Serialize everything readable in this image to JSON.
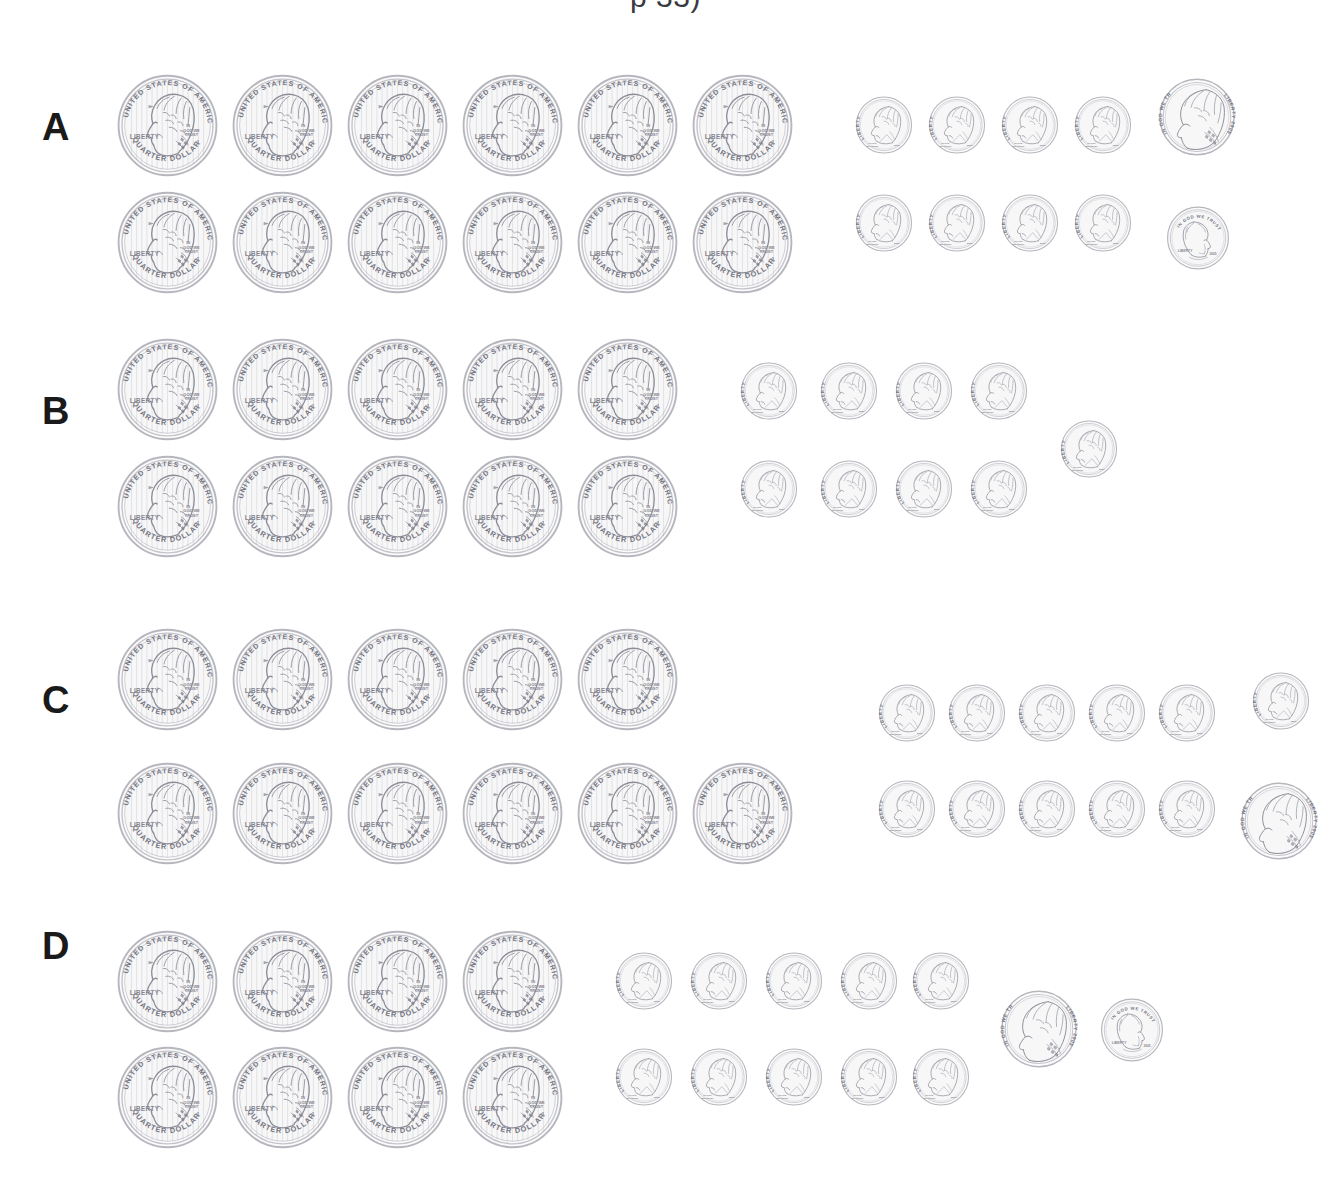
{
  "page": {
    "title_partial": "p 33)",
    "background_color": "#ffffff",
    "label_color": "#1a1a1a",
    "coin_outline_color": "#8d8d98",
    "coin_fill_color": "#f7f7f8"
  },
  "coin_types": {
    "quarter": {
      "name": "quarter",
      "value_label": "QUARTER DOLLAR",
      "obverse_country": "UNITED STATES OF AMERICA",
      "obverse_liberty": "LIBERTY",
      "obverse_motto": "IN GOD WE TRUST",
      "portrait": "George Washington",
      "value_cents": 25,
      "diameter_px": 103
    },
    "dime": {
      "name": "dime",
      "obverse_liberty": "LIBERTY",
      "obverse_motto": "IN GOD WE TRUST",
      "obverse_date": "2005",
      "portrait": "Franklin D. Roosevelt",
      "value_cents": 10,
      "diameter_px": 58
    },
    "nickel": {
      "name": "nickel",
      "obverse_liberty": "LIBERTY 2005",
      "obverse_motto": "IN GOD WE TRUST",
      "portrait": "Thomas Jefferson",
      "value_cents": 5,
      "diameter_px": 78
    },
    "penny": {
      "name": "penny",
      "obverse_liberty": "LIBERTY",
      "obverse_motto": "IN GOD WE TRUST",
      "obverse_date": "2005",
      "portrait": "Abraham Lincoln",
      "value_cents": 1,
      "diameter_px": 64
    }
  },
  "groups": [
    {
      "label": "A",
      "label_x": 42,
      "label_y": 108,
      "top": 30,
      "height": 300,
      "counts": {
        "quarter": 12,
        "dime": 8,
        "nickel": 1,
        "penny": 1
      },
      "total_cents": 386,
      "total_label": "$3.86",
      "coins": [
        {
          "type": "quarter",
          "x": 116,
          "y": 44
        },
        {
          "type": "quarter",
          "x": 231,
          "y": 44
        },
        {
          "type": "quarter",
          "x": 346,
          "y": 44
        },
        {
          "type": "quarter",
          "x": 461,
          "y": 44
        },
        {
          "type": "quarter",
          "x": 576,
          "y": 44
        },
        {
          "type": "quarter",
          "x": 691,
          "y": 44
        },
        {
          "type": "quarter",
          "x": 116,
          "y": 161
        },
        {
          "type": "quarter",
          "x": 231,
          "y": 161
        },
        {
          "type": "quarter",
          "x": 346,
          "y": 161
        },
        {
          "type": "quarter",
          "x": 461,
          "y": 161
        },
        {
          "type": "quarter",
          "x": 576,
          "y": 161
        },
        {
          "type": "quarter",
          "x": 691,
          "y": 161
        },
        {
          "type": "dime",
          "x": 855,
          "y": 66
        },
        {
          "type": "dime",
          "x": 928,
          "y": 66
        },
        {
          "type": "dime",
          "x": 1001,
          "y": 66
        },
        {
          "type": "dime",
          "x": 1074,
          "y": 66
        },
        {
          "type": "dime",
          "x": 855,
          "y": 164
        },
        {
          "type": "dime",
          "x": 928,
          "y": 164
        },
        {
          "type": "dime",
          "x": 1001,
          "y": 164
        },
        {
          "type": "dime",
          "x": 1074,
          "y": 164
        },
        {
          "type": "nickel",
          "x": 1158,
          "y": 48
        },
        {
          "type": "penny",
          "x": 1166,
          "y": 176
        }
      ]
    },
    {
      "label": "B",
      "label_x": 42,
      "label_y": 392,
      "top": 320,
      "height": 300,
      "counts": {
        "quarter": 10,
        "dime": 9,
        "nickel": 0,
        "penny": 0
      },
      "total_cents": 340,
      "total_label": "$3.40",
      "coins": [
        {
          "type": "quarter",
          "x": 116,
          "y": 18
        },
        {
          "type": "quarter",
          "x": 231,
          "y": 18
        },
        {
          "type": "quarter",
          "x": 346,
          "y": 18
        },
        {
          "type": "quarter",
          "x": 461,
          "y": 18
        },
        {
          "type": "quarter",
          "x": 576,
          "y": 18
        },
        {
          "type": "quarter",
          "x": 116,
          "y": 135
        },
        {
          "type": "quarter",
          "x": 231,
          "y": 135
        },
        {
          "type": "quarter",
          "x": 346,
          "y": 135
        },
        {
          "type": "quarter",
          "x": 461,
          "y": 135
        },
        {
          "type": "quarter",
          "x": 576,
          "y": 135
        },
        {
          "type": "dime",
          "x": 740,
          "y": 42
        },
        {
          "type": "dime",
          "x": 820,
          "y": 42
        },
        {
          "type": "dime",
          "x": 895,
          "y": 42
        },
        {
          "type": "dime",
          "x": 970,
          "y": 42
        },
        {
          "type": "dime",
          "x": 740,
          "y": 140
        },
        {
          "type": "dime",
          "x": 820,
          "y": 140
        },
        {
          "type": "dime",
          "x": 895,
          "y": 140
        },
        {
          "type": "dime",
          "x": 970,
          "y": 140
        },
        {
          "type": "dime",
          "x": 1060,
          "y": 100
        }
      ]
    },
    {
      "label": "C",
      "label_x": 42,
      "label_y": 681,
      "top": 610,
      "height": 300,
      "counts": {
        "quarter": 11,
        "dime": 11,
        "nickel": 1,
        "penny": 0
      },
      "total_cents": 390,
      "total_label": "$3.90",
      "coins": [
        {
          "type": "quarter",
          "x": 116,
          "y": 18
        },
        {
          "type": "quarter",
          "x": 231,
          "y": 18
        },
        {
          "type": "quarter",
          "x": 346,
          "y": 18
        },
        {
          "type": "quarter",
          "x": 461,
          "y": 18
        },
        {
          "type": "quarter",
          "x": 576,
          "y": 18
        },
        {
          "type": "quarter",
          "x": 116,
          "y": 152
        },
        {
          "type": "quarter",
          "x": 231,
          "y": 152
        },
        {
          "type": "quarter",
          "x": 346,
          "y": 152
        },
        {
          "type": "quarter",
          "x": 461,
          "y": 152
        },
        {
          "type": "quarter",
          "x": 576,
          "y": 152
        },
        {
          "type": "quarter",
          "x": 691,
          "y": 152
        },
        {
          "type": "dime",
          "x": 878,
          "y": 74
        },
        {
          "type": "dime",
          "x": 948,
          "y": 74
        },
        {
          "type": "dime",
          "x": 1018,
          "y": 74
        },
        {
          "type": "dime",
          "x": 1088,
          "y": 74
        },
        {
          "type": "dime",
          "x": 1158,
          "y": 74
        },
        {
          "type": "dime",
          "x": 1252,
          "y": 62
        },
        {
          "type": "dime",
          "x": 878,
          "y": 170
        },
        {
          "type": "dime",
          "x": 948,
          "y": 170
        },
        {
          "type": "dime",
          "x": 1018,
          "y": 170
        },
        {
          "type": "dime",
          "x": 1088,
          "y": 170
        },
        {
          "type": "dime",
          "x": 1158,
          "y": 170
        },
        {
          "type": "nickel",
          "x": 1240,
          "y": 172
        }
      ]
    },
    {
      "label": "D",
      "label_x": 42,
      "label_y": 927,
      "top": 900,
      "height": 300,
      "counts": {
        "quarter": 8,
        "dime": 10,
        "nickel": 1,
        "penny": 1
      },
      "total_cents": 306,
      "total_label": "$3.06",
      "coins": [
        {
          "type": "quarter",
          "x": 116,
          "y": 30
        },
        {
          "type": "quarter",
          "x": 231,
          "y": 30
        },
        {
          "type": "quarter",
          "x": 346,
          "y": 30
        },
        {
          "type": "quarter",
          "x": 461,
          "y": 30
        },
        {
          "type": "quarter",
          "x": 116,
          "y": 146
        },
        {
          "type": "quarter",
          "x": 231,
          "y": 146
        },
        {
          "type": "quarter",
          "x": 346,
          "y": 146
        },
        {
          "type": "quarter",
          "x": 461,
          "y": 146
        },
        {
          "type": "dime",
          "x": 615,
          "y": 52
        },
        {
          "type": "dime",
          "x": 690,
          "y": 52
        },
        {
          "type": "dime",
          "x": 765,
          "y": 52
        },
        {
          "type": "dime",
          "x": 840,
          "y": 52
        },
        {
          "type": "dime",
          "x": 912,
          "y": 52
        },
        {
          "type": "dime",
          "x": 615,
          "y": 148
        },
        {
          "type": "dime",
          "x": 690,
          "y": 148
        },
        {
          "type": "dime",
          "x": 765,
          "y": 148
        },
        {
          "type": "dime",
          "x": 840,
          "y": 148
        },
        {
          "type": "dime",
          "x": 912,
          "y": 148
        },
        {
          "type": "nickel",
          "x": 1000,
          "y": 90
        },
        {
          "type": "penny",
          "x": 1100,
          "y": 98
        }
      ]
    }
  ]
}
